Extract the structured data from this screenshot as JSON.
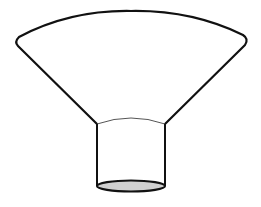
{
  "diagram": {
    "title": "",
    "shape": "funnel",
    "colors": {
      "background": "#ffffff",
      "stroke": "#111111",
      "inner_rim": "#555555",
      "bottom_fill": "#d0d0d0"
    },
    "parts": [
      {
        "name": "funnel-cone",
        "description": "wide arced top opening tapering to neck"
      },
      {
        "name": "funnel-neck",
        "description": "short cylindrical spout"
      },
      {
        "name": "spout-opening",
        "description": "shaded elliptical bottom opening"
      }
    ]
  }
}
